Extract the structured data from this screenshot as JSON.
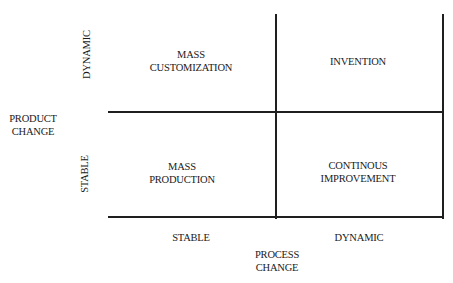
{
  "diagram": {
    "type": "2x2 matrix",
    "y_axis": {
      "title": [
        "PRODUCT",
        "CHANGE"
      ],
      "levels": {
        "top": "DYNAMIC",
        "bottom": "STABLE"
      }
    },
    "x_axis": {
      "title": [
        "PROCESS",
        "CHANGE"
      ],
      "levels": {
        "left": "STABLE",
        "right": "DYNAMIC"
      }
    },
    "quadrants": {
      "top_left": [
        "MASS",
        "CUSTOMIZATION"
      ],
      "top_right": [
        "INVENTION"
      ],
      "bottom_left": [
        "MASS",
        "PRODUCTION"
      ],
      "bottom_right": [
        "CONTINOUS",
        "IMPROVEMENT"
      ]
    },
    "colors": {
      "line": "#1f1f1f",
      "text": "#1a1a1a",
      "background": "#ffffff"
    }
  }
}
